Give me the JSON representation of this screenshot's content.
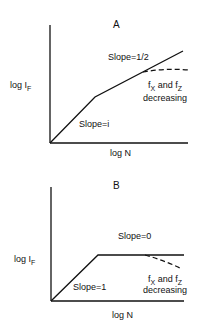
{
  "panels": [
    {
      "id": "A",
      "title": "A",
      "y_label": "log I",
      "y_label_sub": "F",
      "x_label": "log N",
      "segment1_label": "Slope=i",
      "segment2_label": "Slope=1/2",
      "dashed_label_line1_a": "f",
      "dashed_label_line1_a_sub": "X",
      "dashed_label_line1_mid": " and ",
      "dashed_label_line1_b": "f",
      "dashed_label_line1_b_sub": "Z",
      "dashed_label_line2": "decreasing"
    },
    {
      "id": "B",
      "title": "B",
      "y_label": "log I",
      "y_label_sub": "F",
      "x_label": "log N",
      "segment1_label": "Slope=1",
      "segment2_label": "Slope=0",
      "dashed_label_line1_a": "f",
      "dashed_label_line1_a_sub": "X",
      "dashed_label_line1_mid": " and ",
      "dashed_label_line1_b": "f",
      "dashed_label_line1_b_sub": "Z",
      "dashed_label_line2": "decreasing"
    }
  ],
  "colors": {
    "ink": "#111111",
    "background": "#ffffff"
  }
}
